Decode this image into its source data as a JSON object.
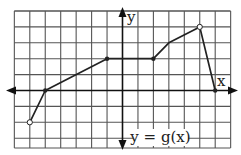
{
  "chart_data": {
    "type": "line",
    "title": "",
    "function_label": "y = g(x)",
    "xlabel": "x",
    "ylabel": "y",
    "grid": true,
    "xlim": [
      -7,
      7
    ],
    "ylim": [
      -3.7,
      5
    ],
    "tick_labels": "none",
    "points": [
      {
        "x": -6,
        "y": -2,
        "closed": false
      },
      {
        "x": -5,
        "y": 0,
        "closed": true
      },
      {
        "x": -1,
        "y": 2,
        "closed": true
      },
      {
        "x": 2,
        "y": 2,
        "closed": true
      },
      {
        "x": 3,
        "y": 3,
        "closed": false,
        "marker": false
      },
      {
        "x": 5,
        "y": 4,
        "closed": false
      },
      {
        "x": 6,
        "y": 0,
        "closed": true
      }
    ],
    "colors": {
      "line": "#222222",
      "grid": "#555555",
      "axis": "#111111"
    }
  }
}
